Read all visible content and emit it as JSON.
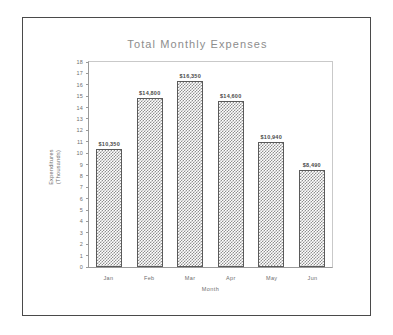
{
  "chart_data": {
    "type": "bar",
    "title": "Total Monthly Expenses",
    "xlabel": "Month",
    "ylabel": "Expenditures\n(Thousands)",
    "ylabel_line1": "Expenditures",
    "ylabel_line2": "(Thousands)",
    "categories": [
      "Jan",
      "Feb",
      "Mar",
      "Apr",
      "May",
      "Jun"
    ],
    "values": [
      10.35,
      14.8,
      16.35,
      14.6,
      10.94,
      8.49
    ],
    "data_labels": [
      "$10,350",
      "$14,800",
      "$16,350",
      "$14,600",
      "$10,940",
      "$8,490"
    ],
    "ylim": [
      0,
      18
    ],
    "ytick_step": 1,
    "yticks": [
      "18",
      "17",
      "16",
      "15",
      "14",
      "13",
      "12",
      "11",
      "10",
      "9",
      "8",
      "7",
      "6",
      "5",
      "4",
      "3",
      "2",
      "1",
      "0"
    ],
    "grid": false,
    "legend": "none",
    "bar_fill": "checkerboard",
    "colors": {
      "frame": "#4a4a4a",
      "axis": "#9a9a9a",
      "title_text": "#8d8d8d",
      "label_text": "#6e6e6e",
      "value_text": "#4a4a4a",
      "bar_pattern": "#8f8f8f",
      "background": "#ffffff"
    }
  }
}
